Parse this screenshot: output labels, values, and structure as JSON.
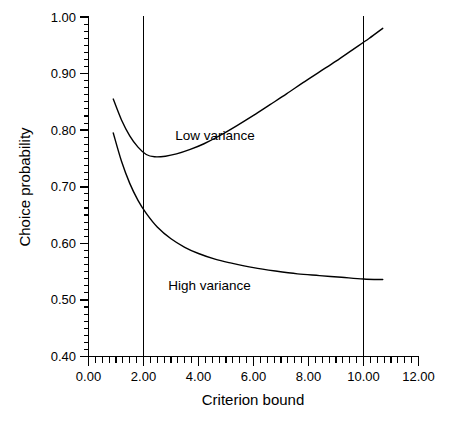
{
  "chart_data": {
    "type": "line",
    "title": "",
    "xlabel": "Criterion bound",
    "ylabel": "Choice probability",
    "xlim": [
      0.0,
      12.0
    ],
    "ylim": [
      0.4,
      1.0
    ],
    "grid": false,
    "legend_position": "inline-annotations",
    "x_ticks": [
      "0.00",
      "2.00",
      "4.00",
      "6.00",
      "8.00",
      "10.00",
      "12.00"
    ],
    "x_tick_values": [
      0.0,
      2.0,
      4.0,
      6.0,
      8.0,
      10.0,
      12.0
    ],
    "x_minor_tick_interval": 0.25,
    "y_ticks": [
      "0.40",
      "0.50",
      "0.60",
      "0.70",
      "0.80",
      "0.90",
      "1.00"
    ],
    "y_tick_values": [
      0.4,
      0.5,
      0.6,
      0.7,
      0.8,
      0.9,
      1.0
    ],
    "y_minor_tick_interval": 0.0125,
    "annotations": [
      {
        "text": "Low variance",
        "x": 4.6,
        "y": 0.783
      },
      {
        "text": "High variance",
        "x": 4.4,
        "y": 0.517
      }
    ],
    "reference_lines": [
      {
        "orientation": "vertical",
        "x": 2.0
      },
      {
        "orientation": "vertical",
        "x": 10.0
      }
    ],
    "series": [
      {
        "name": "Low variance",
        "points": [
          [
            0.9,
            0.855
          ],
          [
            1.2,
            0.818
          ],
          [
            1.5,
            0.79
          ],
          [
            1.8,
            0.77
          ],
          [
            2.1,
            0.757
          ],
          [
            2.4,
            0.753
          ],
          [
            2.8,
            0.754
          ],
          [
            3.2,
            0.758
          ],
          [
            3.7,
            0.766
          ],
          [
            4.2,
            0.776
          ],
          [
            4.8,
            0.791
          ],
          [
            5.4,
            0.808
          ],
          [
            6.0,
            0.826
          ],
          [
            6.6,
            0.845
          ],
          [
            7.2,
            0.864
          ],
          [
            7.8,
            0.884
          ],
          [
            8.4,
            0.903
          ],
          [
            9.0,
            0.922
          ],
          [
            9.6,
            0.942
          ],
          [
            10.2,
            0.962
          ],
          [
            10.7,
            0.98
          ]
        ]
      },
      {
        "name": "High variance",
        "points": [
          [
            0.9,
            0.795
          ],
          [
            1.2,
            0.745
          ],
          [
            1.5,
            0.706
          ],
          [
            1.8,
            0.676
          ],
          [
            2.1,
            0.653
          ],
          [
            2.5,
            0.629
          ],
          [
            3.0,
            0.608
          ],
          [
            3.5,
            0.593
          ],
          [
            4.0,
            0.582
          ],
          [
            4.6,
            0.572
          ],
          [
            5.2,
            0.565
          ],
          [
            6.0,
            0.557
          ],
          [
            6.8,
            0.551
          ],
          [
            7.6,
            0.546
          ],
          [
            8.4,
            0.543
          ],
          [
            9.2,
            0.54
          ],
          [
            10.0,
            0.537
          ],
          [
            10.7,
            0.536
          ]
        ]
      }
    ]
  },
  "axes": {
    "y_label": "Choice probability",
    "x_label": "Criterion bound"
  }
}
